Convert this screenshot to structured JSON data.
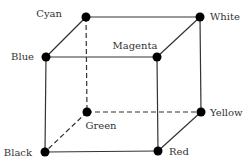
{
  "diagram": {
    "type": "rgb-color-cube",
    "colors": {
      "line": "#333333",
      "node": "#000000",
      "text": "#333333"
    },
    "nodes": [
      {
        "id": "cyan",
        "label": "Cyan",
        "x": 86,
        "y": 17,
        "lx": 62,
        "ly": 17,
        "anchor": "end"
      },
      {
        "id": "white",
        "label": "White",
        "x": 200,
        "y": 17,
        "lx": 210,
        "ly": 20,
        "anchor": "start"
      },
      {
        "id": "blue",
        "label": "Blue",
        "x": 46,
        "y": 57,
        "lx": 34,
        "ly": 60,
        "anchor": "end"
      },
      {
        "id": "magenta",
        "label": "Magenta",
        "x": 157,
        "y": 57,
        "lx": 135,
        "ly": 49,
        "anchor": "middle"
      },
      {
        "id": "green",
        "label": "Green",
        "x": 87,
        "y": 112,
        "lx": 101,
        "ly": 129,
        "anchor": "middle"
      },
      {
        "id": "yellow",
        "label": "Yellow",
        "x": 201,
        "y": 112,
        "lx": 210,
        "ly": 116,
        "anchor": "start"
      },
      {
        "id": "black",
        "label": "Black",
        "x": 45,
        "y": 152,
        "lx": 32,
        "ly": 156,
        "anchor": "end"
      },
      {
        "id": "red",
        "label": "Red",
        "x": 158,
        "y": 151,
        "lx": 169,
        "ly": 155,
        "anchor": "start"
      }
    ],
    "edges": [
      {
        "from": "cyan",
        "to": "white",
        "style": "solid"
      },
      {
        "from": "blue",
        "to": "magenta",
        "style": "solid"
      },
      {
        "from": "cyan",
        "to": "blue",
        "style": "solid"
      },
      {
        "from": "white",
        "to": "magenta",
        "style": "solid"
      },
      {
        "from": "blue",
        "to": "black",
        "style": "solid"
      },
      {
        "from": "magenta",
        "to": "red",
        "style": "solid"
      },
      {
        "from": "white",
        "to": "yellow",
        "style": "solid"
      },
      {
        "from": "black",
        "to": "red",
        "style": "solid"
      },
      {
        "from": "red",
        "to": "yellow",
        "style": "solid"
      },
      {
        "from": "cyan",
        "to": "green",
        "style": "dashed"
      },
      {
        "from": "green",
        "to": "yellow",
        "style": "dashed"
      },
      {
        "from": "green",
        "to": "black",
        "style": "dashed"
      }
    ]
  }
}
